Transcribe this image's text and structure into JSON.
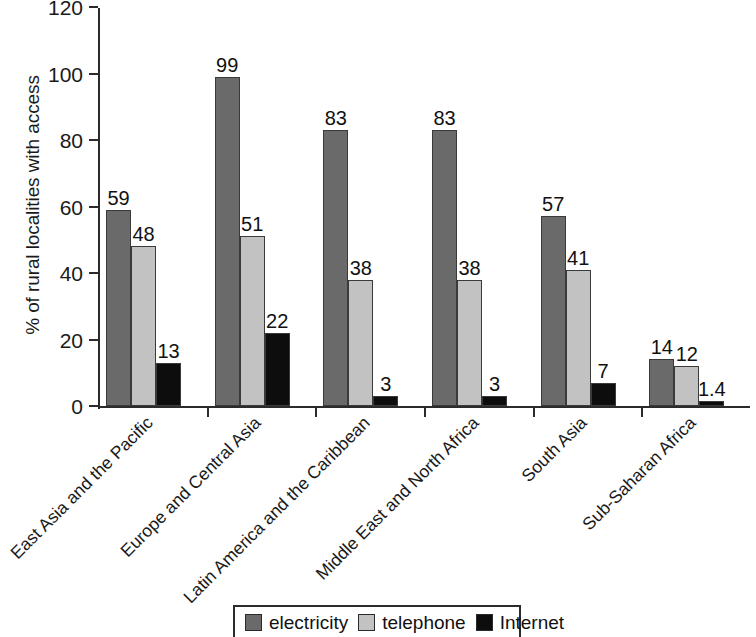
{
  "chart_data": {
    "type": "bar",
    "title": "",
    "subtitle": "",
    "xlabel": "",
    "ylabel": "% of rural localities with access",
    "ylim": [
      0,
      120
    ],
    "ytick_values": [
      0,
      20,
      40,
      60,
      80,
      100,
      120
    ],
    "ytick_labels": [
      "0",
      "20",
      "40",
      "60",
      "80",
      "100",
      "120"
    ],
    "grid": false,
    "legend_position": "bottom-center",
    "categories": [
      "East Asia and the Pacific",
      "Europe and Central Asia",
      "Latin America and the Caribbean",
      "Middle East and North Africa",
      "South Asia",
      "Sub-Saharan Africa"
    ],
    "series": [
      {
        "name": "electricity",
        "color": "#6a6a6a",
        "values": [
          59,
          99,
          83,
          83,
          57,
          14
        ],
        "value_labels": [
          "59",
          "99",
          "83",
          "83",
          "57",
          "14"
        ]
      },
      {
        "name": "telephone",
        "color": "#c2c2c2",
        "values": [
          48,
          51,
          38,
          38,
          41,
          12
        ],
        "value_labels": [
          "48",
          "51",
          "38",
          "38",
          "41",
          "12"
        ]
      },
      {
        "name": "Internet",
        "color": "#0d0d0d",
        "values": [
          13,
          22,
          3,
          3,
          7,
          1.4
        ],
        "value_labels": [
          "13",
          "22",
          "3",
          "3",
          "7",
          "1.4"
        ]
      }
    ]
  },
  "legend": {
    "items": [
      {
        "label": "electricity",
        "color": "#6a6a6a"
      },
      {
        "label": "telephone",
        "color": "#c2c2c2"
      },
      {
        "label": "Internet",
        "color": "#0d0d0d"
      }
    ]
  },
  "axes": {
    "y_title": "% of rural localities with access",
    "axis_color": "#2b2b2b"
  }
}
